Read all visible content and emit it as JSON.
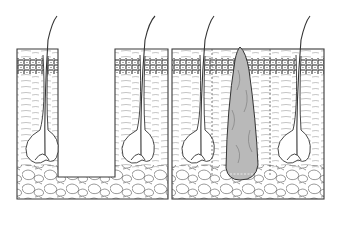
{
  "figure": {
    "title": "Skin cross-section: tissue excision vs. graft placement",
    "panels": [
      {
        "id": "left",
        "description": "Skin section with rectangular tissue removed between two hair follicles"
      },
      {
        "id": "right",
        "description": "Skin section with tapered grey graft inserted between two hair follicles, dashed guide lines"
      }
    ],
    "colors": {
      "line": "#3a3a3a",
      "graft_fill": "#b9b9b9",
      "background": "#ffffff"
    }
  }
}
